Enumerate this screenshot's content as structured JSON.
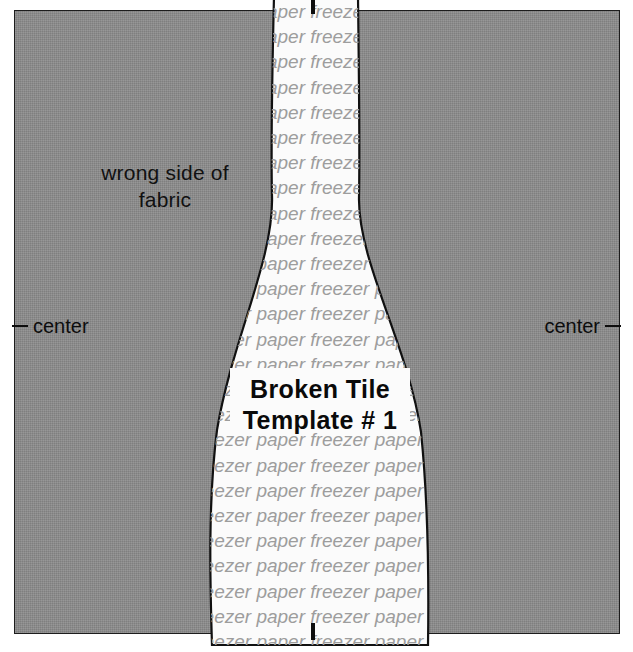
{
  "canvas": {
    "width": 633,
    "height": 652
  },
  "fabric": {
    "label": "wrong side of\nfabric",
    "color": "#8b8b8b",
    "border_color": "#1d1d1d"
  },
  "center_marks": {
    "left_label": "center",
    "right_label": "center",
    "color": "#0d0d0d"
  },
  "template": {
    "title_line1": "Broken Tile",
    "title_line2": "Template # 1",
    "paper_color": "#fbfbfb",
    "outline_color": "#111111",
    "watermark": {
      "text": "freezer paper",
      "color": "#9d9d9d",
      "rows": [
        "freezer paper  freezer paper  freezer paper",
        "freezer paper  freezer paper  freezer paper",
        "freezer paper  freezer paper  freezer paper",
        "freezer paper  freezer paper  freezer paper",
        "freezer paper  freezer paper  freezer paper",
        "freezer paper  freezer paper  freezer paper",
        "freezer paper  freezer paper  freezer paper",
        "freezer paper  freezer paper  freezer paper",
        "freezer paper  freezer paper  freezer paper",
        "freezer paper  freezer paper  freezer paper",
        "freezer paper  freezer paper  freezer paper",
        "freezer paper  freezer paper  freezer paper",
        "freezer paper  freezer paper  freezer paper",
        "freezer paper  freezer paper  freezer paper",
        "freezer paper  freezer paper  freezer paper",
        "freezer paper  freezer paper  freezer paper",
        "freezer paper  freezer paper  freezer paper",
        "freezer paper  freezer paper  freezer paper",
        "freezer paper  freezer paper  freezer paper",
        "freezer paper  freezer paper  freezer paper",
        "freezer paper  freezer paper  freezer paper",
        "freezer paper  freezer paper  freezer paper",
        "freezer paper  freezer paper  freezer paper",
        "freezer paper  freezer paper  freezer paper",
        "freezer paper  freezer paper  freezer paper",
        "freezer paper  freezer paper  freezer paper"
      ]
    }
  }
}
